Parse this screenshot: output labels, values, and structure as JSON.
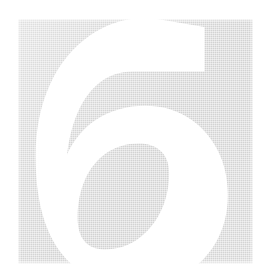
{
  "page": {
    "kind": "decorative-chapter-number",
    "background_color": "#ffffff",
    "width": 271,
    "height": 280
  },
  "panel": {
    "name": "number-panel",
    "fill_color": "#d2d2d2",
    "texture": "halftone-dither",
    "x": 18,
    "y": 19,
    "width": 235,
    "height": 245
  },
  "numeral": {
    "value": "6",
    "color": "#ffffff",
    "style": "knockout",
    "alt_text": "6"
  }
}
